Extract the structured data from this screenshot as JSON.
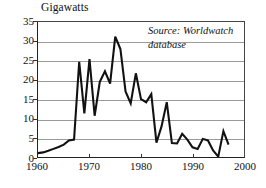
{
  "chart_data": {
    "type": "line",
    "title": "Gigawatts",
    "xlabel": "",
    "ylabel": "Gigawatts",
    "xlim": [
      1960,
      2000
    ],
    "ylim": [
      0,
      35
    ],
    "grid": true,
    "legend": "none",
    "x_ticks": [
      "1960",
      "1970",
      "1980",
      "1990",
      "2000"
    ],
    "x_tick_values": [
      1960,
      1970,
      1980,
      1990,
      2000
    ],
    "y_ticks": [
      "0",
      "5",
      "10",
      "15",
      "20",
      "25",
      "30",
      "35"
    ],
    "y_tick_values": [
      0,
      5,
      10,
      15,
      20,
      25,
      30,
      35
    ],
    "line_color": "#111111",
    "grid_color": "#9a9a9a",
    "annotations": [
      {
        "line1": "Source: Worldwatch",
        "line2": "database"
      }
    ],
    "x": [
      1960,
      1961,
      1962,
      1963,
      1964,
      1965,
      1966,
      1967,
      1968,
      1969,
      1970,
      1971,
      1972,
      1973,
      1974,
      1975,
      1976,
      1977,
      1978,
      1979,
      1980,
      1981,
      1982,
      1983,
      1984,
      1985,
      1986,
      1987,
      1988,
      1989,
      1990,
      1991,
      1992,
      1993,
      1994,
      1995,
      1996,
      1997
    ],
    "values": [
      1.0,
      1.2,
      1.6,
      2.1,
      2.6,
      3.2,
      4.3,
      4.5,
      24.7,
      11.3,
      25.4,
      10.7,
      19.5,
      22.2,
      19.0,
      31.2,
      28.0,
      17.0,
      13.9,
      21.7,
      15.0,
      14.2,
      16.3,
      3.7,
      8.0,
      14.2,
      3.6,
      3.5,
      6.0,
      4.5,
      2.5,
      2.1,
      4.7,
      4.3,
      1.7,
      0.1,
      6.7,
      3.2
    ]
  },
  "chart_meta": {
    "title_label": "Gigawatts",
    "source_label": "Source: Worldwatch",
    "source_label_2": "database"
  }
}
